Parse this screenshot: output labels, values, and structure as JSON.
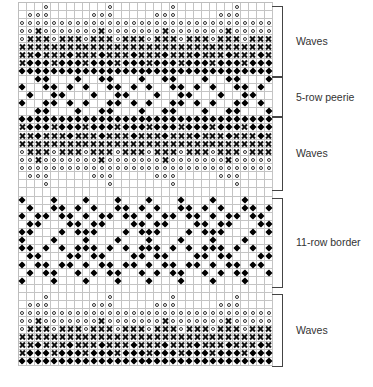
{
  "chart": {
    "columns": 32,
    "repeat": 8,
    "symbols": {
      "o": "open-circle",
      "x": "cross",
      "d": "filled-diamond",
      "-": "empty"
    },
    "sections": [
      {
        "label": "Waves",
        "rows": [
          "---o----",
          "-ooo----",
          "oooooooo",
          "ooxooo oo",
          "oxxxoxxx",
          "xxxxxxxx",
          "xxdxxxdx",
          "xdddxddd",
          "dddddddd"
        ]
      },
      {
        "label": "5-row peerie",
        "rows": [
          "--dd---d",
          "d--dd-d-",
          "-d--dd--",
          "d--dd-d-",
          "--dd---d"
        ]
      },
      {
        "label": "Waves",
        "rows": [
          "dddddddd",
          "xdddxddd",
          "xxdxxxdx",
          "xxxxxxxx",
          "oxxxoxxx",
          "ooxooo oo",
          "oooooooo",
          "-ooo----",
          "---o----"
        ]
      },
      {
        "label": "",
        "rows": [
          "--------"
        ]
      },
      {
        "label": "11-row border",
        "rows": [
          "d---d---",
          "-d--dd-d",
          "d-dd-dd-",
          "-dd---dd",
          "dd---d-d",
          "d---d---",
          "dd-d-d-d",
          "-dd---dd",
          "d-dd-dd-",
          "-d-dd--d",
          "d---d---"
        ]
      },
      {
        "label": "",
        "rows": [
          "--------"
        ]
      },
      {
        "label": "Waves",
        "rows": [
          "---o----",
          "-ooo----",
          "oooooooo",
          "ooxooo oo",
          "oxxxoxxx",
          "xxxxxxxx",
          "xxdxxxdx",
          "xdddxddd",
          "dddddddd"
        ]
      }
    ]
  },
  "labels": {
    "waves_top": "Waves",
    "peerie": "5-row peerie",
    "waves_middle": "Waves",
    "border": "11-row border",
    "waves_bottom": "Waves"
  }
}
